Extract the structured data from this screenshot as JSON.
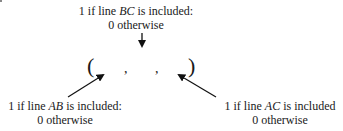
{
  "diagram": {
    "top_label": {
      "line1_prefix": "1 if line ",
      "line1_var": "BC",
      "line1_suffix": " is included:",
      "line2": "0 otherwise"
    },
    "left_label": {
      "line1_prefix": "1 if line ",
      "line1_var": "AB",
      "line1_suffix": " is included:",
      "line2": "0 otherwise"
    },
    "right_label": {
      "line1_prefix": "1 if line ",
      "line1_var": "AC",
      "line1_suffix": " is included",
      "line2": "0 otherwise"
    },
    "tuple": {
      "open": "(",
      "sep1": ",",
      "sep2": ",",
      "close": ")"
    },
    "arrow_color": "#111111"
  }
}
